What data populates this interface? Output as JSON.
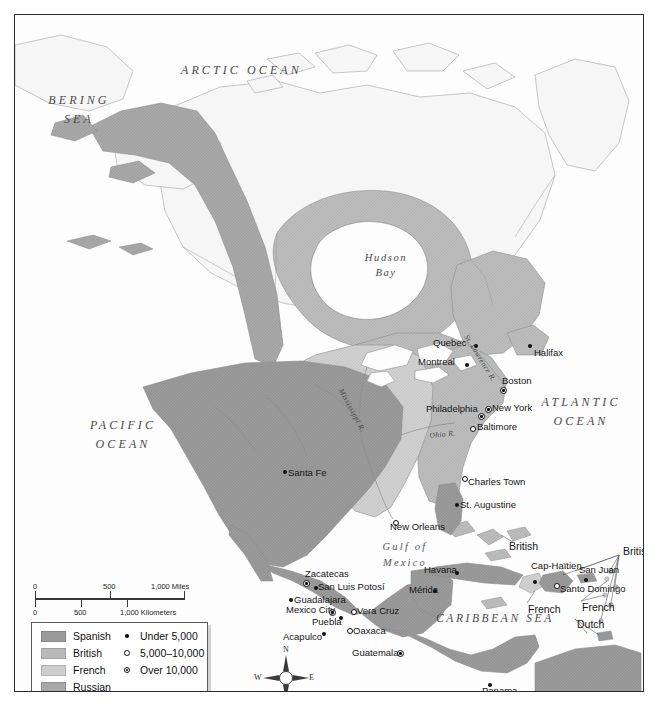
{
  "map": {
    "title": "Colonial North America and the Caribbean",
    "water_labels": [
      {
        "name": "arctic-ocean",
        "text": "ARCTIC  OCEAN",
        "lines": [
          "ARCTIC  OCEAN"
        ]
      },
      {
        "name": "bering-sea",
        "text": "BERING SEA",
        "lines": [
          "BERING",
          "SEA"
        ]
      },
      {
        "name": "pacific-ocean",
        "text": "PACIFIC OCEAN",
        "lines": [
          "PACIFIC",
          "OCEAN"
        ]
      },
      {
        "name": "atlantic-ocean",
        "text": "ATLANTIC OCEAN",
        "lines": [
          "ATLANTIC",
          "OCEAN"
        ]
      },
      {
        "name": "hudson-bay",
        "text": "Hudson Bay",
        "lines": [
          "Hudson",
          "Bay"
        ]
      },
      {
        "name": "gulf-of-mexico",
        "text": "Gulf of Mexico",
        "lines": [
          "Gulf  of",
          "Mexico"
        ]
      },
      {
        "name": "caribbean-sea",
        "text": "CARIBBEAN SEA",
        "lines": [
          "CARIBBEAN  SEA"
        ]
      }
    ],
    "arctic_ocean": "ARCTIC  OCEAN",
    "bering_sea_l1": "BERING",
    "bering_sea_l2": "SEA",
    "pacific_l1": "PACIFIC",
    "pacific_l2": "OCEAN",
    "atlantic_l1": "ATLANTIC",
    "atlantic_l2": "OCEAN",
    "hudson_l1": "Hudson",
    "hudson_l2": "Bay",
    "gulf_l1": "Gulf  of",
    "gulf_l2": "Mexico",
    "caribbean": "CARIBBEAN  SEA",
    "rivers": [
      {
        "name": "mississippi-river",
        "label": "Mississippi R."
      },
      {
        "name": "ohio-river",
        "label": "Ohio R."
      },
      {
        "name": "st-lawrence-river",
        "label": "St. Lawrence R."
      }
    ],
    "river_mississippi": "Mississippi R.",
    "river_ohio": "Ohio R.",
    "river_st_lawrence": "St. Lawrence R.",
    "cities": [
      {
        "name": "quebec",
        "label": "Quebec",
        "size": "small",
        "x": 459,
        "y": 329,
        "tx": 418,
        "ty": 322
      },
      {
        "name": "montreal",
        "label": "Montreal",
        "size": "small",
        "x": 450,
        "y": 348,
        "tx": 403,
        "ty": 341
      },
      {
        "name": "halifax",
        "label": "Halifax",
        "size": "small",
        "x": 513,
        "y": 329,
        "tx": 519,
        "ty": 332
      },
      {
        "name": "boston",
        "label": "Boston",
        "size": "large",
        "x": 485,
        "y": 372,
        "tx": 487,
        "ty": 360
      },
      {
        "name": "new-york",
        "label": "New York",
        "size": "large",
        "x": 470,
        "y": 391,
        "tx": 477,
        "ty": 387
      },
      {
        "name": "philadelphia",
        "label": "Philadelphia",
        "size": "large",
        "x": 463,
        "y": 398,
        "tx": 411,
        "ty": 388
      },
      {
        "name": "baltimore",
        "label": "Baltimore",
        "size": "hollow",
        "x": 455,
        "y": 411,
        "tx": 462,
        "ty": 406
      },
      {
        "name": "charles-town",
        "label": "Charles Town",
        "size": "hollow",
        "x": 447,
        "y": 461,
        "tx": 453,
        "ty": 461
      },
      {
        "name": "st-augustine",
        "label": "St. Augustine",
        "size": "small",
        "x": 440,
        "y": 488,
        "tx": 445,
        "ty": 484
      },
      {
        "name": "new-orleans",
        "label": "New Orleans",
        "size": "hollow",
        "x": 378,
        "y": 505,
        "tx": 375,
        "ty": 506
      },
      {
        "name": "santa-fe",
        "label": "Santa Fe",
        "size": "small",
        "x": 268,
        "y": 455,
        "tx": 273,
        "ty": 452
      },
      {
        "name": "havana",
        "label": "Havana",
        "size": "small",
        "x": 440,
        "y": 556,
        "tx": 409,
        "ty": 549
      },
      {
        "name": "zacatecas",
        "label": "Zacatecas",
        "size": "large",
        "x": 288,
        "y": 565,
        "tx": 290,
        "ty": 553
      },
      {
        "name": "san-luis-potosi",
        "label": "San Luis Potosí",
        "size": "small",
        "x": 299,
        "y": 571,
        "tx": 303,
        "ty": 566
      },
      {
        "name": "guadalajara",
        "label": "Guadalajara",
        "size": "small",
        "x": 274,
        "y": 583,
        "tx": 279,
        "ty": 579
      },
      {
        "name": "mexico-city",
        "label": "Mexico City",
        "size": "large",
        "x": 314,
        "y": 594,
        "tx": 271,
        "ty": 589
      },
      {
        "name": "puebla",
        "label": "Puebla",
        "size": "small",
        "x": 324,
        "y": 601,
        "tx": 297,
        "ty": 601
      },
      {
        "name": "vera-cruz",
        "label": "Vera Cruz",
        "size": "hollow",
        "x": 336,
        "y": 594,
        "tx": 342,
        "ty": 590
      },
      {
        "name": "oaxaca",
        "label": "Oaxaca",
        "size": "hollow",
        "x": 332,
        "y": 613,
        "tx": 338,
        "ty": 610
      },
      {
        "name": "acapulco",
        "label": "Acapulco",
        "size": "small",
        "x": 307,
        "y": 617,
        "tx": 268,
        "ty": 616
      },
      {
        "name": "merida",
        "label": "Mérida",
        "size": "small",
        "x": 418,
        "y": 574,
        "tx": 394,
        "ty": 569
      },
      {
        "name": "guatemala",
        "label": "Guatemala",
        "size": "large",
        "x": 382,
        "y": 635,
        "tx": 337,
        "ty": 632
      },
      {
        "name": "cap-haitien",
        "label": "Cap-Haïtien",
        "size": "small",
        "x": 518,
        "y": 565,
        "tx": 516,
        "ty": 545
      },
      {
        "name": "san-juan",
        "label": "San Juan",
        "size": "small",
        "x": 569,
        "y": 563,
        "tx": 564,
        "ty": 549
      },
      {
        "name": "santo-domingo",
        "label": "Santo Domingo",
        "size": "hollow",
        "x": 539,
        "y": 568,
        "tx": 545,
        "ty": 568
      },
      {
        "name": "panama",
        "label": "Panama",
        "size": "small",
        "x": 473,
        "y": 668,
        "tx": 467,
        "ty": 670
      }
    ],
    "colony_labels": [
      {
        "name": "colony-british-bahamas",
        "label": "British",
        "x": 494,
        "y": 525
      },
      {
        "name": "colony-british-lesser",
        "label": "British",
        "x": 608,
        "y": 530
      },
      {
        "name": "colony-french-antilles",
        "label": "French",
        "x": 513,
        "y": 588
      },
      {
        "name": "colony-french-lesser",
        "label": "French",
        "x": 567,
        "y": 586
      },
      {
        "name": "colony-dutch",
        "label": "Dutch",
        "x": 562,
        "y": 603
      }
    ]
  },
  "scale": {
    "miles_0": "0",
    "miles_500": "500",
    "miles_1000": "1,000 Miles",
    "km_0": "0",
    "km_500": "500",
    "km_1000": "1,000 Kilometers"
  },
  "legend": {
    "powers": [
      {
        "name": "spanish",
        "label": "Spanish",
        "color": "#9a9a9a"
      },
      {
        "name": "british",
        "label": "British",
        "color": "#b9b9b9"
      },
      {
        "name": "french",
        "label": "French",
        "color": "#cdcdcd"
      },
      {
        "name": "russian",
        "label": "Russian",
        "color": "#a8a8a8"
      }
    ],
    "spanish_label": "Spanish",
    "british_label": "British",
    "french_label": "French",
    "russian_label": "Russian",
    "sizes": [
      {
        "name": "under-5000",
        "label": "Under 5,000",
        "symbol": "dot"
      },
      {
        "name": "5000-10000",
        "label": "5,000–10,000",
        "symbol": "ring"
      },
      {
        "name": "over-10000",
        "label": "Over 10,000",
        "symbol": "ring-dot"
      }
    ],
    "under_label": "Under 5,000",
    "mid_label": "5,000–10,000",
    "over_label": "Over 10,000"
  },
  "compass": {
    "north": "N",
    "south": "S",
    "east": "E",
    "west": "W"
  },
  "colors": {
    "spanish": "#9a9a9a",
    "british": "#b9b9b9",
    "french": "#cdcdcd",
    "russian": "#a8a8a8",
    "water": "#fdfdfd",
    "unclaimed": "#f4f4f4",
    "outline": "#8d8d8d",
    "frame": "#2b2b2b"
  }
}
